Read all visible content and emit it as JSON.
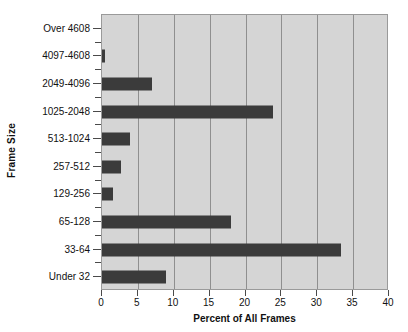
{
  "chart_data": {
    "type": "bar",
    "orientation": "horizontal",
    "title": "",
    "xlabel": "Percent of All Frames",
    "ylabel": "Frame Size",
    "categories": [
      "Under 32",
      "33-64",
      "65-128",
      "129-256",
      "257-512",
      "513-1024",
      "1025-2048",
      "2049-4096",
      "4097-4608",
      "Over 4608"
    ],
    "values": [
      8.9,
      33.3,
      18.0,
      1.6,
      2.7,
      3.9,
      23.8,
      7.0,
      0.4,
      0.0
    ],
    "xlim": [
      0,
      40
    ],
    "xticks": [
      0,
      5,
      10,
      15,
      20,
      25,
      30,
      35,
      40
    ],
    "xtick_labels": [
      "0",
      "5",
      "10",
      "15",
      "20",
      "25",
      "30",
      "35",
      "40"
    ],
    "grid": "vertical",
    "legend": "none",
    "bar_color": "#3b3b3b",
    "plot_background": "#d5d5d5",
    "grid_color": "#8f8f8f",
    "axis_color": "#4a4a4a",
    "text_color": "#111111",
    "page_background": "#ffffff"
  }
}
